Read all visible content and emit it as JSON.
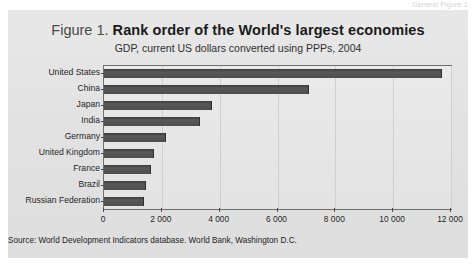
{
  "page": {
    "header_fragment": "General Figure 1.",
    "background_color": "#ffffff",
    "panel_color": "#e4e4e4"
  },
  "figure": {
    "figure_number": "Figure 1.",
    "title": "Rank order of the World's largest economies",
    "subtitle": "GDP, current US dollars converted using PPPs, 2004",
    "source": "Source:  World Development Indicators database. World Bank, Washington D.C.",
    "bar_color": "#4e4e4e",
    "axis_color": "#6f6f6f"
  },
  "chart_data": {
    "type": "bar",
    "orientation": "horizontal",
    "title": "Figure 1. Rank order of the World's largest economies",
    "subtitle": "GDP, current US dollars converted using PPPs, 2004",
    "xlabel": "",
    "ylabel": "",
    "categories": [
      "United States",
      "China",
      "Japan",
      "India",
      "Germany",
      "United Kingdom",
      "France",
      "Brazil",
      "Russian Federation"
    ],
    "values": [
      11700,
      7100,
      3750,
      3320,
      2150,
      1720,
      1620,
      1450,
      1400
    ],
    "units": "billions of current US dollars (PPP)",
    "xlim": [
      0,
      12000
    ],
    "xticks": [
      0,
      2000,
      4000,
      6000,
      8000,
      10000,
      12000
    ],
    "xticklabels": [
      "0",
      "2 000",
      "4 000",
      "6 000",
      "8 000",
      "10 000",
      "12 000"
    ],
    "grid": true,
    "legend": false
  }
}
